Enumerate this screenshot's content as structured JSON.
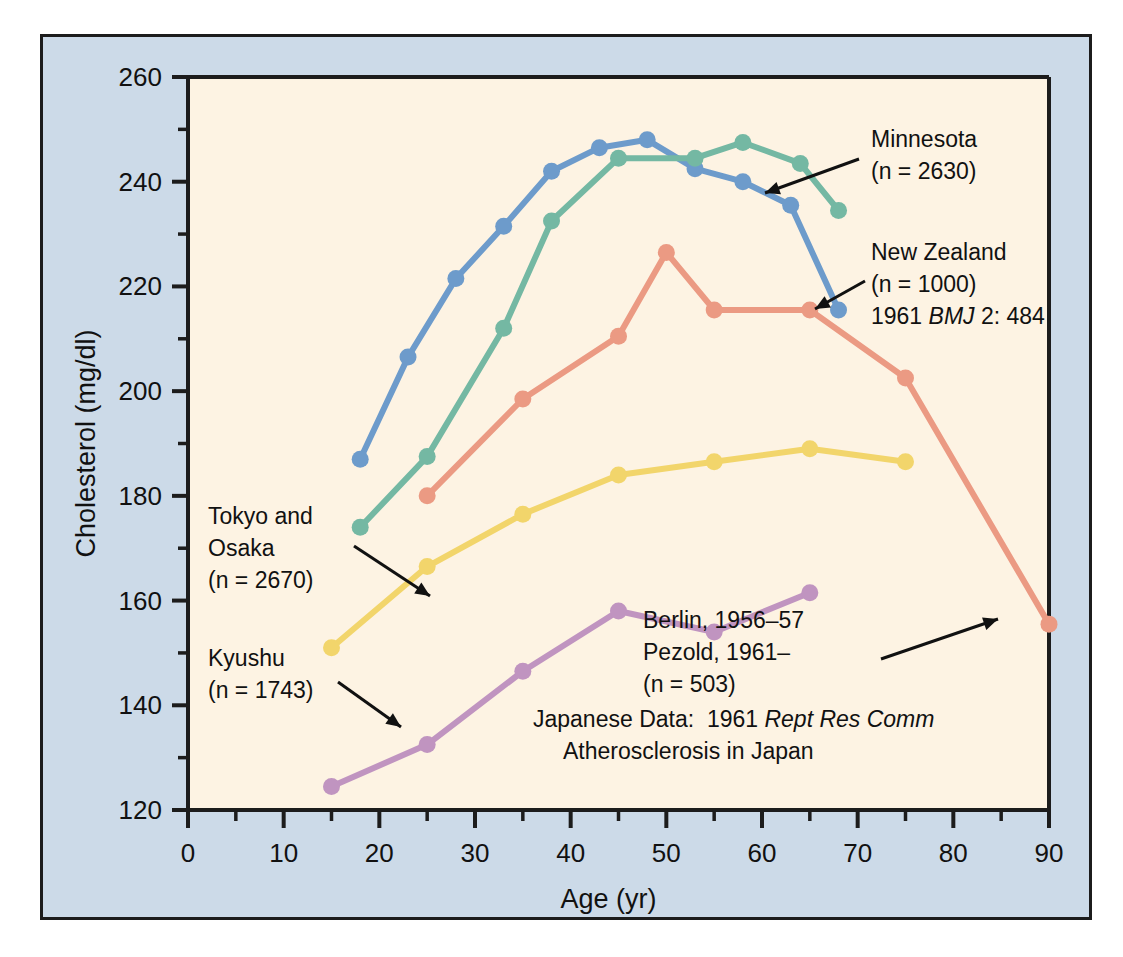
{
  "figure": {
    "background_color": "#ccdae8",
    "plot_background_color": "#fdf3e3",
    "border_color": "#1c1c1c"
  },
  "chart_data": {
    "type": "line",
    "title": "",
    "xlabel": "Age (yr)",
    "ylabel": "Cholesterol (mg/dl)",
    "xlim": [
      0,
      90
    ],
    "ylim": [
      120,
      260
    ],
    "xticks": [
      0,
      10,
      20,
      30,
      40,
      50,
      60,
      70,
      80,
      90
    ],
    "xtick_labels": [
      "0",
      "10",
      "20",
      "30",
      "40",
      "50",
      "60",
      "70",
      "80",
      "90"
    ],
    "xminor_step": 5,
    "yticks": [
      120,
      140,
      160,
      180,
      200,
      220,
      240,
      260
    ],
    "ytick_labels": [
      "120",
      "140",
      "160",
      "180",
      "200",
      "220",
      "240",
      "260"
    ],
    "yminor_step": 10,
    "grid": false,
    "legend": "annotations",
    "series": [
      {
        "name": "Minnesota",
        "color": "#6d9bcb",
        "x": [
          18,
          23,
          28,
          33,
          38,
          43,
          48,
          53,
          58,
          63,
          68
        ],
        "y": [
          187,
          206.5,
          221.5,
          231.5,
          242,
          246.5,
          248,
          242.5,
          240,
          235.5,
          215.5
        ]
      },
      {
        "name": "New Zealand",
        "color": "#74b8a3",
        "x": [
          18,
          25,
          33,
          38,
          45,
          53,
          58,
          64,
          68
        ],
        "y": [
          174,
          187.5,
          212,
          232.5,
          244.5,
          244.5,
          247.5,
          243.5,
          234.5
        ]
      },
      {
        "name": "Berlin",
        "color": "#eb9a83",
        "x": [
          25,
          35,
          45,
          50,
          55,
          65,
          75,
          90
        ],
        "y": [
          180,
          198.5,
          210.5,
          226.5,
          215.5,
          215.5,
          202.5,
          155.5
        ]
      },
      {
        "name": "Tokyo and Osaka",
        "color": "#f2d56b",
        "x": [
          15,
          25,
          35,
          45,
          55,
          65,
          75
        ],
        "y": [
          151,
          166.5,
          176.5,
          184,
          186.5,
          189,
          186.5
        ]
      },
      {
        "name": "Kyushu",
        "color": "#c094c0",
        "x": [
          15,
          25,
          35,
          45,
          55,
          65
        ],
        "y": [
          124.5,
          132.5,
          146.5,
          158,
          154,
          161.5
        ]
      }
    ],
    "annotations": [
      {
        "id": "minnesota",
        "lines": [
          "Minnesota",
          "(n = 2630)"
        ]
      },
      {
        "id": "new-zealand",
        "lines": [
          "New Zealand",
          "(n = 1000)",
          "1961 BMJ 2: 484"
        ]
      },
      {
        "id": "berlin",
        "lines": [
          "Berlin, 1956–57",
          "Pezold, 1961–",
          "(n = 503)"
        ]
      },
      {
        "id": "tokyo-osaka",
        "lines": [
          "Tokyo and",
          "Osaka",
          "(n = 2670)"
        ]
      },
      {
        "id": "kyushu",
        "lines": [
          "Kyushu",
          "(n = 1743)"
        ]
      },
      {
        "id": "source-note",
        "lines": [
          "Japanese Data:  1961 Rept Res Comm",
          "Atherosclerosis in Japan"
        ]
      }
    ]
  },
  "annotation_text": {
    "minnesota_l1": "Minnesota",
    "minnesota_l2": "(n = 2630)",
    "newzealand_l1": "New Zealand",
    "newzealand_l2": "(n = 1000)",
    "newzealand_l3a": "1961 ",
    "newzealand_l3b": "BMJ",
    "newzealand_l3c": " 2: 484",
    "berlin_l1": "Berlin, 1956–57",
    "berlin_l2": "Pezold, 1961–",
    "berlin_l3": "(n = 503)",
    "tokyo_l1": "Tokyo and",
    "tokyo_l2": "Osaka",
    "tokyo_l3": "(n = 2670)",
    "kyushu_l1": "Kyushu",
    "kyushu_l2": "(n = 1743)",
    "note_l1a": "Japanese Data:  1961 ",
    "note_l1b": "Rept Res Comm",
    "note_l2": "Atherosclerosis in Japan"
  }
}
